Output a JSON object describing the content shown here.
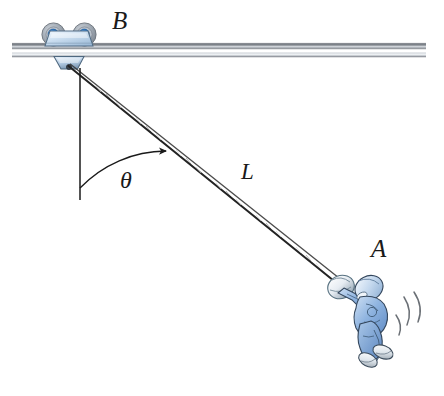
{
  "figure": {
    "background_color": "#ffffff",
    "width": 444,
    "height": 396
  },
  "labels": {
    "trolley_label": "B",
    "person_label": "A",
    "rope_length_label": "L",
    "angle_label": "θ"
  },
  "rail": {
    "name": "horizontal-rail",
    "color_top": "#8c8f96",
    "color_mid": "#c8ccd2",
    "color_bottom": "#6e7278",
    "x_start": 12,
    "x_end": 426,
    "y": 49
  },
  "trolley": {
    "name": "trolley-B",
    "body_color": "#cfe0f0",
    "body_edge": "#5a6b7d",
    "wheel_rim": "#9aa3ad",
    "wheel_hub": "#1c6fc4",
    "hanger_color": "#b9cfe4",
    "center_x": 68,
    "center_y": 44
  },
  "rope": {
    "name": "rope-L",
    "color": "#2b2b2b",
    "from_x": 68,
    "from_y": 65,
    "to_x": 338,
    "to_y": 284,
    "strands": 2
  },
  "vertical_reference": {
    "name": "vertical-reference-line",
    "color": "#1a1a1a",
    "x": 80,
    "y_top": 68,
    "y_bottom": 200
  },
  "angle_arc": {
    "name": "angle-arc-theta",
    "color": "#1a1a1a",
    "vertex_x": 80,
    "vertex_y": 68,
    "radius": 120,
    "start_deg": 90,
    "end_deg": 39,
    "has_arrowhead": true
  },
  "person": {
    "name": "person-A",
    "clothing_color": "#7fa8dc",
    "clothing_shade": "#b9d0ea",
    "outline_color": "#2b3a4a",
    "shoe_color": "#e4e8ec",
    "helmet_color": "#c6d8ee",
    "center_x": 370,
    "center_y": 312
  },
  "motion_lines": {
    "name": "motion-swoosh-lines",
    "color": "#6b7076",
    "count": 3
  },
  "grip": {
    "name": "rope-grip-handle",
    "color": "#eef2f6",
    "edge": "#5a6b7d",
    "x": 340,
    "y": 286
  }
}
